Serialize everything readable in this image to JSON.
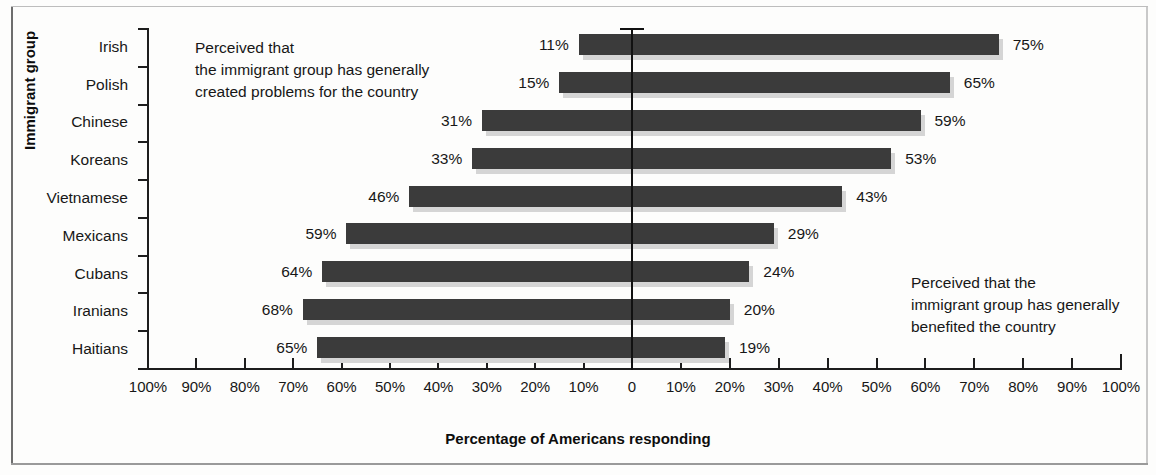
{
  "figure": {
    "cropped_top_text": "",
    "x_axis_title": "Percentage of Americans responding",
    "y_axis_title": "Immigrant group",
    "annotation_left": "Perceived that\nthe immigrant group has generally\ncreated problems for the country",
    "annotation_right": "Perceived that the\nimmigrant group has generally\nbenefited the country",
    "colors": {
      "bar": "#3b3b3b",
      "bar_shadow": "#d5d5d5",
      "axis": "#1d1d1d",
      "text": "#171717",
      "background": "#fdfdfc"
    }
  },
  "chart_data": {
    "type": "bar",
    "orientation": "horizontal",
    "subtype": "diverging-bidirectional",
    "title": "",
    "xlabel": "Percentage of Americans responding",
    "ylabel": "Immigrant group",
    "categories": [
      "Irish",
      "Polish",
      "Chinese",
      "Koreans",
      "Vietnamese",
      "Mexicans",
      "Cubans",
      "Iranians",
      "Haitians"
    ],
    "series": [
      {
        "name": "Perceived that the immigrant group has generally created problems for the country",
        "direction": "left",
        "values": [
          11,
          15,
          31,
          33,
          46,
          59,
          64,
          68,
          65
        ],
        "labels": [
          "11%",
          "15%",
          "31%",
          "33%",
          "46%",
          "59%",
          "64%",
          "68%",
          "65%"
        ]
      },
      {
        "name": "Perceived that the immigrant group has generally benefited the country",
        "direction": "right",
        "values": [
          75,
          65,
          59,
          53,
          43,
          29,
          24,
          20,
          19
        ],
        "labels": [
          "75%",
          "65%",
          "59%",
          "53%",
          "43%",
          "29%",
          "24%",
          "20%",
          "19%"
        ]
      }
    ],
    "xlim": [
      -100,
      100
    ],
    "xticks": [
      -100,
      -90,
      -80,
      -70,
      -60,
      -50,
      -40,
      -30,
      -20,
      -10,
      0,
      10,
      20,
      30,
      40,
      50,
      60,
      70,
      80,
      90,
      100
    ],
    "xticklabels": [
      "100%",
      "90%",
      "80%",
      "70%",
      "60%",
      "50%",
      "40%",
      "30%",
      "20%",
      "10%",
      "0",
      "10%",
      "20%",
      "30%",
      "40%",
      "50%",
      "60%",
      "70%",
      "80%",
      "90%",
      "100%"
    ],
    "grid": false,
    "legend": "none",
    "zero_line": true,
    "annotations": [
      {
        "text": "Perceived that\nthe immigrant group has generally\ncreated problems for the country",
        "side": "left"
      },
      {
        "text": "Perceived that the\nimmigrant group has generally\nbenefited the country",
        "side": "right"
      }
    ]
  }
}
